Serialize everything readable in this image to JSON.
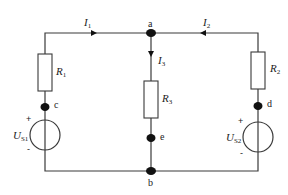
{
  "diagram": {
    "type": "circuit",
    "nodes": {
      "a": "a",
      "b": "b",
      "c": "c",
      "d": "d",
      "e": "e"
    },
    "currents": {
      "I1": {
        "symbol": "I",
        "sub": "1"
      },
      "I2": {
        "symbol": "I",
        "sub": "2"
      },
      "I3": {
        "symbol": "I",
        "sub": "3"
      }
    },
    "resistors": {
      "R1": {
        "symbol": "R",
        "sub": "1"
      },
      "R2": {
        "symbol": "R",
        "sub": "2"
      },
      "R3": {
        "symbol": "R",
        "sub": "3"
      }
    },
    "sources": {
      "US1": {
        "symbol": "U",
        "sub": "S1",
        "plus": "+",
        "minus": "-"
      },
      "US2": {
        "symbol": "U",
        "sub": "S2",
        "plus": "+",
        "minus": "-"
      }
    },
    "colors": {
      "wire": "#3a3a3a",
      "node": "#111111",
      "background": "#ffffff"
    }
  }
}
